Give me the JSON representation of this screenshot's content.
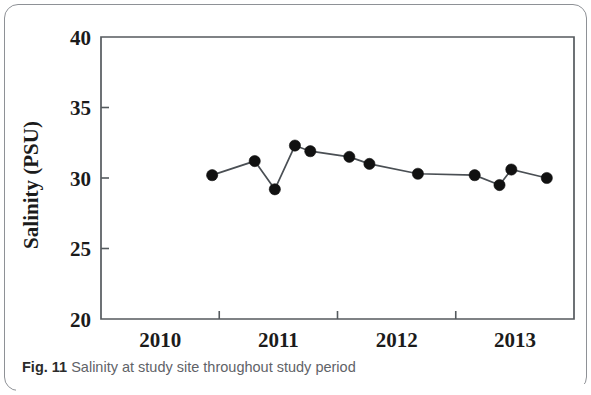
{
  "figure": {
    "label": "Fig. 11",
    "caption": "Salinity at study site throughout study period"
  },
  "colors": {
    "marker": "#111111",
    "line": "#4a4f54",
    "axis": "#555a5e",
    "text": "#1b1b1b",
    "caption_text": "#5f6368",
    "card_border": "#8e9196",
    "background": "#ffffff"
  },
  "chart_data": {
    "type": "line",
    "title": "",
    "subtitle": "",
    "xlabel": "",
    "ylabel": "Salinity (PSU)",
    "xlim": [
      2009.5,
      2013.5
    ],
    "ylim": [
      20,
      40
    ],
    "grid": false,
    "legend": false,
    "legend_position": "none",
    "markers": "filled-circle",
    "x_ticks": [
      2010,
      2011,
      2012,
      2013
    ],
    "x_tick_labels": [
      "2010",
      "2011",
      "2012",
      "2013"
    ],
    "y_ticks": [
      20,
      25,
      30,
      35,
      40
    ],
    "y_tick_labels": [
      "20",
      "25",
      "30",
      "35",
      "40"
    ],
    "x": [
      2010.44,
      2010.8,
      2010.97,
      2011.14,
      2011.27,
      2011.6,
      2011.77,
      2012.18,
      2012.66,
      2012.87,
      2012.97,
      2013.27
    ],
    "values": [
      30.2,
      31.2,
      29.2,
      32.3,
      31.9,
      31.5,
      31.0,
      30.3,
      30.2,
      29.5,
      30.6,
      30.0
    ],
    "series": [
      {
        "name": "Salinity",
        "x": [
          2010.44,
          2010.8,
          2010.97,
          2011.14,
          2011.27,
          2011.6,
          2011.77,
          2012.18,
          2012.66,
          2012.87,
          2012.97,
          2013.27
        ],
        "values": [
          30.2,
          31.2,
          29.2,
          32.3,
          31.9,
          31.5,
          31.0,
          30.3,
          30.2,
          29.5,
          30.6,
          30.0
        ]
      }
    ],
    "annotations": []
  }
}
